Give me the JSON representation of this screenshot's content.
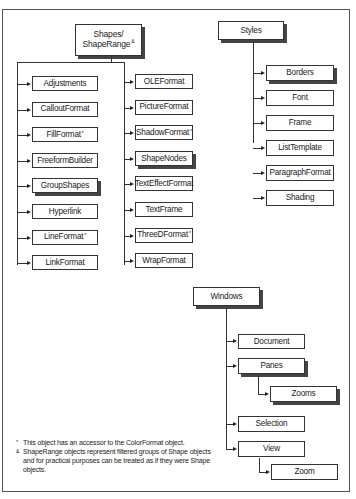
{
  "diagram": {
    "shapes_group": {
      "root": {
        "label": "Shapes/",
        "label2": "ShapeRange",
        "mark": "&"
      },
      "left_column": [
        {
          "label": "Adjustments",
          "mark": "",
          "shadow": false
        },
        {
          "label": "CalloutFormat",
          "mark": "",
          "shadow": false
        },
        {
          "label": "FillFormat",
          "mark": "*",
          "shadow": false
        },
        {
          "label": "FreeformBuilder",
          "mark": "",
          "shadow": false
        },
        {
          "label": "GroupShapes",
          "mark": "",
          "shadow": true
        },
        {
          "label": "Hyperlink",
          "mark": "",
          "shadow": false
        },
        {
          "label": "LineFormat",
          "mark": "*",
          "shadow": false
        },
        {
          "label": "LinkFormat",
          "mark": "",
          "shadow": false
        }
      ],
      "right_column": [
        {
          "label": "OLEFormat",
          "mark": "",
          "shadow": false
        },
        {
          "label": "PictureFormat",
          "mark": "",
          "shadow": false
        },
        {
          "label": "ShadowFormat",
          "mark": "*",
          "shadow": false
        },
        {
          "label": "ShapeNodes",
          "mark": "",
          "shadow": true
        },
        {
          "label": "TextEffectFormat",
          "mark": "",
          "shadow": false
        },
        {
          "label": "TextFrame",
          "mark": "",
          "shadow": false
        },
        {
          "label": "ThreeDFormat",
          "mark": "*",
          "shadow": false
        },
        {
          "label": "WrapFormat",
          "mark": "",
          "shadow": false
        }
      ]
    },
    "styles_group": {
      "root": {
        "label": "Styles"
      },
      "children": [
        {
          "label": "Borders",
          "shadow": true
        },
        {
          "label": "Font",
          "shadow": false
        },
        {
          "label": "Frame",
          "shadow": false
        },
        {
          "label": "ListTemplate",
          "shadow": false
        },
        {
          "label": "ParagraphFormat",
          "shadow": false
        },
        {
          "label": "Shading",
          "shadow": false
        }
      ]
    },
    "windows_group": {
      "root": {
        "label": "Windows"
      },
      "document": {
        "label": "Document"
      },
      "panes": {
        "label": "Panes"
      },
      "zooms": {
        "label": "Zooms"
      },
      "selection": {
        "label": "Selection"
      },
      "view": {
        "label": "View"
      },
      "zoom": {
        "label": "Zoom"
      }
    }
  },
  "notes": [
    {
      "mark": "*",
      "text": "This object has an accessor to the ColorFormat object."
    },
    {
      "mark": "&",
      "text": "ShapeRange objects represent filtered groups of Shape objects and for practical purposes can be treated as if they were Shape objects."
    }
  ]
}
